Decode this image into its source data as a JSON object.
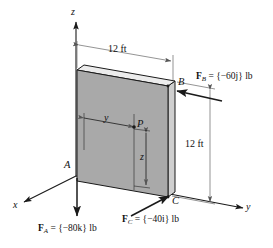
{
  "figure": {
    "plate_fill": "#a9a9a9",
    "plate_top_fill": "#e8e8e8",
    "plate_edge_fill": "#cfcfcf",
    "line_color": "#1a1a1a"
  },
  "axes": {
    "z_label": "z",
    "y_label": "y",
    "x_label": "x"
  },
  "points": {
    "A": "A",
    "B": "B",
    "C": "C",
    "P": "P"
  },
  "dimensions": {
    "top_width": "12 ft",
    "right_height": "12 ft",
    "inner_horizontal": "y",
    "inner_vertical": "z"
  },
  "forces": [
    {
      "name": "force-a",
      "symbol": "F",
      "subscript": "A",
      "equals": "=",
      "value": "{−80k} lb",
      "vector_text": "F",
      "full_label": "F_A = {−80k} lb",
      "direction": "down",
      "at_point": "A"
    },
    {
      "name": "force-b",
      "symbol": "F",
      "subscript": "B",
      "equals": "=",
      "value": "{−60j} lb",
      "full_label": "F_B = {−60j} lb",
      "direction": "left",
      "at_point": "B"
    },
    {
      "name": "force-c",
      "symbol": "F",
      "subscript": "C",
      "equals": "=",
      "value": "{−40i} lb",
      "full_label": "F_C = {−40i} lb",
      "direction": "up-right",
      "at_point": "C"
    }
  ]
}
